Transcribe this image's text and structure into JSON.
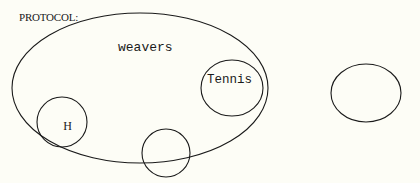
{
  "header": {
    "label": "PROTOCOL:"
  },
  "colors": {
    "background": "#fdfdf6",
    "stroke": "#1a1a1a"
  },
  "diagram": {
    "outer_set": {
      "label": "weavers",
      "cx": 140,
      "cy": 88,
      "rx": 128,
      "ry": 75
    },
    "sets": [
      {
        "name": "h-set",
        "label": "H",
        "cx": 62,
        "cy": 122,
        "rx": 25,
        "ry": 25
      },
      {
        "name": "tennis-set",
        "label": "Tennis",
        "cx": 232,
        "cy": 88,
        "rx": 31,
        "ry": 28
      },
      {
        "name": "bottom-set",
        "label": "",
        "cx": 166,
        "cy": 153,
        "rx": 24,
        "ry": 24
      },
      {
        "name": "right-set",
        "label": "",
        "cx": 366,
        "cy": 93,
        "rx": 35,
        "ry": 29
      }
    ]
  }
}
